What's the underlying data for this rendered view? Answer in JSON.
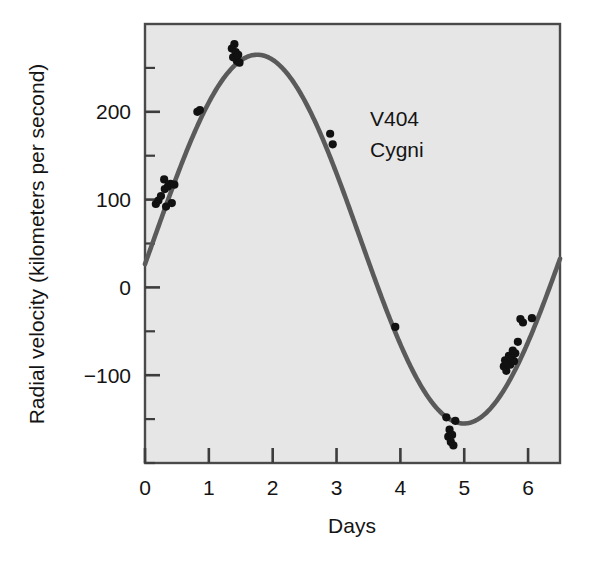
{
  "chart_data": {
    "type": "scatter",
    "title": "",
    "annotation": [
      "V404",
      "Cygni"
    ],
    "xlabel": "Days",
    "ylabel": "Radial velocity (kilometers per second)",
    "xlim": [
      0,
      6.5
    ],
    "ylim": [
      -200,
      300
    ],
    "grid": false,
    "legend": null,
    "xticks": [
      0,
      1,
      2,
      3,
      4,
      5,
      6
    ],
    "xtick_labels": [
      "0",
      "1",
      "2",
      "3",
      "4",
      "5",
      "6"
    ],
    "xminor_step": 1,
    "yticks": [
      -200,
      -150,
      -100,
      -50,
      0,
      50,
      100,
      150,
      200,
      250
    ],
    "ytick_labeled": [
      200,
      100,
      0,
      -100
    ],
    "ytick_labels": [
      "200",
      "100",
      "0",
      "−100"
    ],
    "fit_curve": {
      "name": "radial velocity sinusoid",
      "form": "v = gamma + K*sin(2*pi*(t - t0)/P)",
      "gamma": 55,
      "amplitude_K": 210,
      "period_days": 6.47,
      "t0_days": 0.14,
      "color": "#5a5a5a",
      "peak": {
        "x": 1.76,
        "y": 265
      },
      "trough": {
        "x": 4.99,
        "y": -155
      }
    },
    "series": [
      {
        "name": "observed radial velocities",
        "marker": "filled-circle",
        "color": "#111111",
        "points": [
          [
            0.17,
            95
          ],
          [
            0.21,
            99
          ],
          [
            0.25,
            104
          ],
          [
            0.3,
            123
          ],
          [
            0.31,
            112
          ],
          [
            0.33,
            92
          ],
          [
            0.36,
            115
          ],
          [
            0.4,
            118
          ],
          [
            0.42,
            96
          ],
          [
            0.46,
            117
          ],
          [
            0.82,
            200
          ],
          [
            0.86,
            202
          ],
          [
            1.36,
            272
          ],
          [
            1.38,
            262
          ],
          [
            1.4,
            277
          ],
          [
            1.42,
            268
          ],
          [
            1.44,
            258
          ],
          [
            1.46,
            265
          ],
          [
            1.48,
            256
          ],
          [
            2.9,
            175
          ],
          [
            2.94,
            163
          ],
          [
            3.92,
            -45
          ],
          [
            4.72,
            -148
          ],
          [
            4.75,
            -170
          ],
          [
            4.77,
            -162
          ],
          [
            4.79,
            -176
          ],
          [
            4.81,
            -168
          ],
          [
            4.83,
            -180
          ],
          [
            4.86,
            -152
          ],
          [
            5.62,
            -90
          ],
          [
            5.64,
            -83
          ],
          [
            5.66,
            -95
          ],
          [
            5.68,
            -86
          ],
          [
            5.7,
            -78
          ],
          [
            5.72,
            -88
          ],
          [
            5.74,
            -80
          ],
          [
            5.76,
            -72
          ],
          [
            5.78,
            -84
          ],
          [
            5.8,
            -75
          ],
          [
            5.84,
            -62
          ],
          [
            5.88,
            -36
          ],
          [
            5.92,
            -40
          ],
          [
            6.06,
            -35
          ]
        ]
      }
    ]
  },
  "figure": {
    "background": "#ffffff",
    "plot_background": "#e6e6e6",
    "frame_color": "#4a4a4a",
    "curve_color": "#5a5a5a",
    "point_color": "#111111"
  }
}
